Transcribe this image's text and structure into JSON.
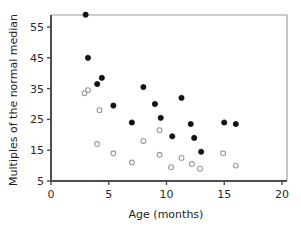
{
  "chart_data": {
    "type": "scatter",
    "title": "",
    "subtitle": "",
    "xlabel": "Age (months)",
    "ylabel": "Multiples of the normal median",
    "xlim": [
      0,
      20
    ],
    "ylim": [
      5,
      60
    ],
    "xticks": [
      0,
      5,
      10,
      15,
      20
    ],
    "yticks": [
      5,
      15,
      25,
      35,
      45,
      55
    ],
    "grid": false,
    "legend": "none",
    "frame": "box",
    "colors": {
      "filled_marker": "#111111",
      "open_marker": "#9a9a9a",
      "axis": "#4d4d4d",
      "frame": "#9e9e9e",
      "background": "#ffffff",
      "text": "#2b2b2b"
    },
    "series": [
      {
        "name": "filled",
        "marker": "filled-circle",
        "points": [
          [
            3.0,
            59.0
          ],
          [
            3.2,
            45.0
          ],
          [
            4.0,
            36.5
          ],
          [
            4.4,
            38.5
          ],
          [
            5.4,
            29.5
          ],
          [
            7.0,
            24.0
          ],
          [
            8.0,
            35.5
          ],
          [
            9.0,
            30.0
          ],
          [
            9.5,
            25.5
          ],
          [
            10.5,
            19.5
          ],
          [
            11.3,
            32.0
          ],
          [
            12.1,
            23.5
          ],
          [
            12.4,
            19.0
          ],
          [
            13.0,
            14.5
          ],
          [
            15.0,
            24.0
          ],
          [
            16.0,
            23.5
          ]
        ]
      },
      {
        "name": "open",
        "marker": "open-circle",
        "points": [
          [
            2.9,
            33.5
          ],
          [
            3.2,
            34.5
          ],
          [
            4.2,
            28.0
          ],
          [
            4.0,
            17.0
          ],
          [
            5.4,
            14.0
          ],
          [
            7.0,
            11.0
          ],
          [
            8.0,
            18.0
          ],
          [
            9.4,
            21.5
          ],
          [
            9.4,
            13.5
          ],
          [
            10.4,
            9.5
          ],
          [
            11.3,
            12.5
          ],
          [
            12.2,
            10.5
          ],
          [
            12.9,
            9.0
          ],
          [
            14.9,
            14.0
          ],
          [
            16.0,
            10.0
          ]
        ]
      }
    ]
  }
}
